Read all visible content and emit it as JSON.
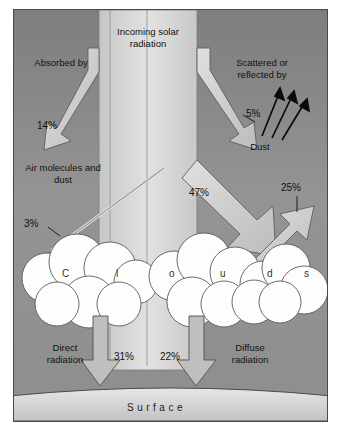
{
  "diagram": {
    "title": "Incoming solar radiation",
    "left_heading": "Absorbed by",
    "right_heading": "Scattered or reflected by",
    "absorber_label": "Air molecules and dust",
    "dust_label": "Dust",
    "cloud_letters": [
      "C",
      "l",
      "o",
      "u",
      "d",
      "s"
    ],
    "surface_label": "Surface",
    "direct_label": "Direct radiation",
    "diffuse_label": "Diffuse radiation",
    "values": {
      "absorbed_air": "14%",
      "scattered_dust": "5%",
      "absorbed_clouds": "3%",
      "to_clouds": "47%",
      "reflected_clouds": "25%",
      "direct": "31%",
      "diffuse": "22%"
    },
    "colors": {
      "background": "#8e8e8e",
      "beam": "#d9d9d9",
      "arrow": "#cccccc",
      "cloud": "#fdfdfd",
      "ink": "#111111"
    }
  }
}
